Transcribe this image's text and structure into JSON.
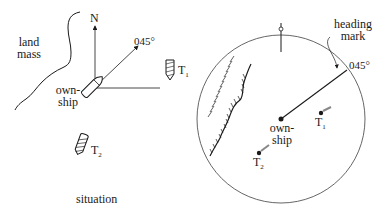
{
  "situation": {
    "caption": "situation",
    "land_label_line1": "land",
    "land_label_line2": "mass",
    "north_label": "N",
    "heading_label": "045°",
    "ownship_line1": "own-",
    "ownship_line2": "ship",
    "target1_label": "T",
    "target1_sub": "1",
    "target2_label": "T",
    "target2_sub": "2"
  },
  "radar": {
    "heading_mark_line1": "heading",
    "heading_mark_line2": "mark",
    "heading_label": "045°",
    "ownship_line1": "own-",
    "ownship_line2": "ship",
    "target1_label": "T",
    "target1_sub": "1",
    "target2_label": "T",
    "target2_sub": "2"
  },
  "colors": {
    "ink": "#1a1a1a",
    "background": "#ffffff"
  }
}
